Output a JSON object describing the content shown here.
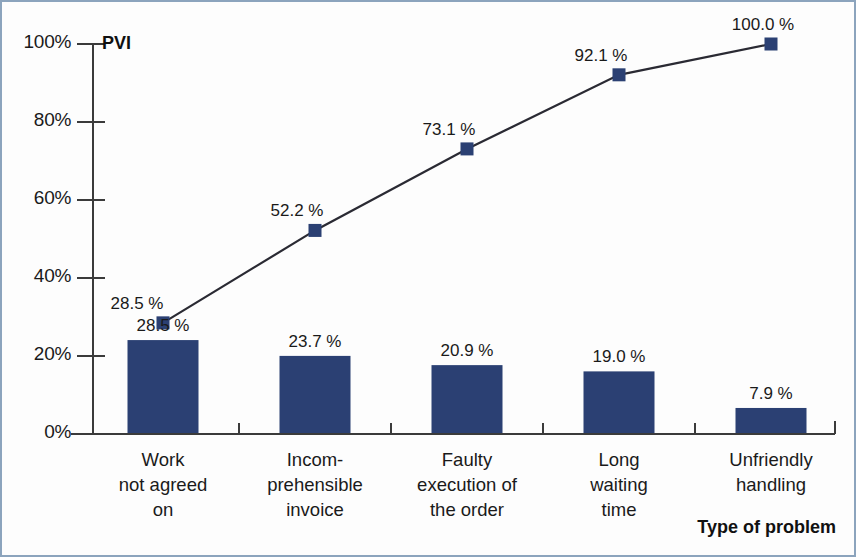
{
  "chart_data": {
    "type": "bar",
    "title": "",
    "subtitle": "",
    "xlabel": "Type of problem",
    "ylabel": "PVI",
    "ylim": [
      0,
      100
    ],
    "grid": false,
    "legend": "none",
    "categories": [
      "Work\nnot agreed\non",
      "Incom-\nprehensible\ninvoice",
      "Faulty\nexecution of\nthe order",
      "Long\nwaiting\ntime",
      "Unfriendly\nhandling"
    ],
    "category_lines": [
      [
        "Work",
        "not agreed",
        "on"
      ],
      [
        "Incom-",
        "prehensible",
        "invoice"
      ],
      [
        "Faulty",
        "execution of",
        "the order"
      ],
      [
        "Long",
        "waiting",
        "time"
      ],
      [
        "Unfriendly",
        "handling"
      ]
    ],
    "series": [
      {
        "name": "Share of problems",
        "kind": "bar",
        "values": [
          28.5,
          23.7,
          20.9,
          19.0,
          7.9
        ],
        "labels": [
          "28.5 %",
          "23.7 %",
          "20.9 %",
          "19.0 %",
          "7.9 %"
        ],
        "color": "#2b4073"
      },
      {
        "name": "PVI",
        "kind": "line",
        "values": [
          28.5,
          52.2,
          73.1,
          92.1,
          100.0
        ],
        "labels": [
          "28.5 %",
          "52.2 %",
          "73.1 %",
          "92.1 %",
          "100.0 %"
        ],
        "color": "#2b4073",
        "line_color": "#2a2a33"
      }
    ],
    "yticks": [
      0,
      20,
      40,
      60,
      80,
      100
    ],
    "ytick_labels": [
      "0%",
      "20%",
      "40%",
      "60%",
      "80%",
      "100%"
    ]
  },
  "axes": {
    "y_axis_caption": "PVI",
    "x_axis_caption": "Type of problem"
  },
  "style": {
    "bar_color": "#2b4073",
    "marker_color": "#2b4073",
    "line_color": "#2a2a33",
    "axis_color": "#3b3b3b",
    "border_color": "#8ca4bd",
    "background": "#fdfdfd"
  }
}
